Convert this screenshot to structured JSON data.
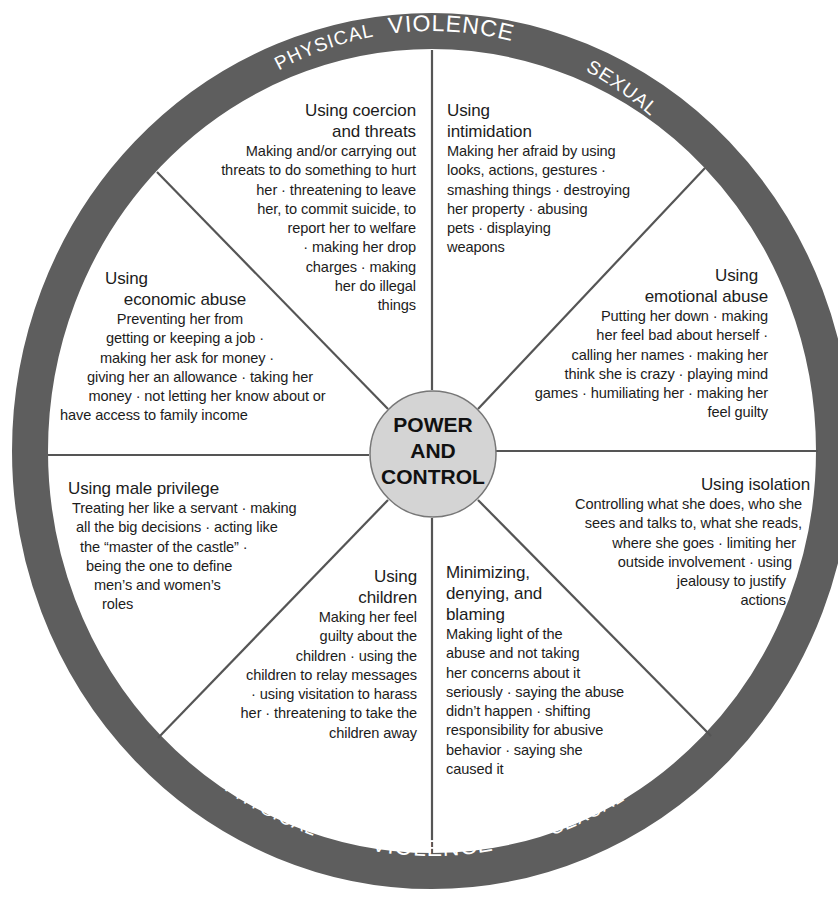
{
  "diagram": {
    "colors": {
      "ring": "#5e5e5e",
      "hub_fill": "#d4d4d4",
      "divider": "#555555",
      "text": "#1c1c1c",
      "ring_text": "#ffffff"
    },
    "outer_ring": {
      "top": {
        "left": "PHYSICAL",
        "center": "VIOLENCE",
        "right": "SEXUAL"
      },
      "bottom": {
        "left": "PHYSICAL",
        "center": "VIOLENCE",
        "right": "SEXUAL"
      }
    },
    "hub": {
      "line1": "POWER",
      "line2": "AND",
      "line3": "CONTROL"
    },
    "segments": {
      "coercion": {
        "title": [
          "Using coercion",
          "and threats"
        ],
        "lines": [
          "Making and/or carrying out",
          "threats to do something to hurt",
          "her · threatening to leave",
          "her, to commit suicide, to",
          "report her to welfare",
          "· making her drop",
          "charges · making",
          "her do illegal",
          "things"
        ]
      },
      "intimidation": {
        "title": [
          "Using",
          "intimidation"
        ],
        "lines": [
          "Making her afraid by using",
          "looks, actions, gestures ·",
          "smashing things · destroying",
          "her property · abusing",
          "pets · displaying",
          "weapons"
        ]
      },
      "emotional": {
        "title": [
          "Using",
          "emotional abuse"
        ],
        "lines": [
          "Putting her down · making",
          "her feel bad about herself ·",
          "calling her names · making her",
          "think she is crazy · playing mind",
          "games · humiliating her · making her",
          "feel guilty"
        ]
      },
      "isolation": {
        "title": [
          "Using isolation"
        ],
        "lines": [
          "Controlling what she does, who she",
          "sees and talks to, what she reads,",
          "where she goes · limiting her",
          "outside involvement · using",
          "jealousy to justify",
          "actions"
        ]
      },
      "minimizing": {
        "title": [
          "Minimizing,",
          "denying, and",
          "blaming"
        ],
        "lines": [
          "Making light of the",
          "abuse and not taking",
          "her concerns about it",
          "seriously · saying the abuse",
          "didn’t happen · shifting",
          "responsibility for abusive",
          "behavior · saying she",
          "caused it"
        ]
      },
      "children": {
        "title": [
          "Using",
          "children"
        ],
        "lines": [
          "Making her feel",
          "guilty about the",
          "children · using the",
          "children to relay messages",
          "· using visitation to harass",
          "her · threatening to take the",
          "children away"
        ]
      },
      "male_privilege": {
        "title": [
          "Using male privilege"
        ],
        "lines": [
          "Treating her like a servant · making",
          "all the big decisions · acting like",
          "the “master of the castle” ·",
          "being the one to define",
          "men’s and women’s",
          "roles"
        ]
      },
      "economic": {
        "title": [
          "Using",
          "economic abuse"
        ],
        "lines": [
          "Preventing her from",
          "getting or keeping a job ·",
          "making her ask for money ·",
          "giving her an allowance · taking her",
          "money · not letting her know about or",
          "have access to family income"
        ]
      }
    }
  }
}
